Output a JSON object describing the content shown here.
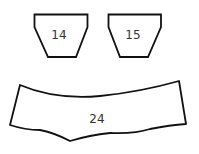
{
  "shapes": [
    {
      "id": "piece-14",
      "label": "14"
    },
    {
      "id": "piece-15",
      "label": "15"
    },
    {
      "id": "piece-24",
      "label": "24"
    }
  ],
  "colors": {
    "stroke": "#111111",
    "fill": "#ffffff",
    "text": "#333333"
  }
}
